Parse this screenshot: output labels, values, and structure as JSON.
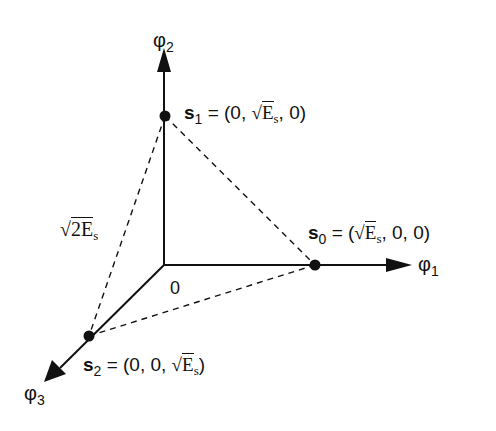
{
  "diagram": {
    "type": "signal-space-constellation",
    "axes": {
      "phi1": {
        "label": "φ",
        "sub": "1"
      },
      "phi2": {
        "label": "φ",
        "sub": "2"
      },
      "phi3": {
        "label": "φ",
        "sub": "3"
      }
    },
    "origin_label": "0",
    "points": [
      {
        "name": "s",
        "sub": "0",
        "eq": "= (",
        "coords_pre": "",
        "sqrt": "√",
        "radicand": "E",
        "rsub": "s",
        "coords_post": ", 0, 0)"
      },
      {
        "name": "s",
        "sub": "1",
        "eq": "= (",
        "coords_pre": "0, ",
        "sqrt": "√",
        "radicand": "E",
        "rsub": "s",
        "coords_post": ", 0)"
      },
      {
        "name": "s",
        "sub": "2",
        "eq": "= (",
        "coords_pre": "0, 0, ",
        "sqrt": "√",
        "radicand": "E",
        "rsub": "s",
        "coords_post": ")"
      }
    ],
    "distance_label": {
      "sqrt": "√",
      "radicand": "2E",
      "rsub": "s"
    },
    "colors": {
      "line": "#111111",
      "background": "#ffffff"
    }
  }
}
